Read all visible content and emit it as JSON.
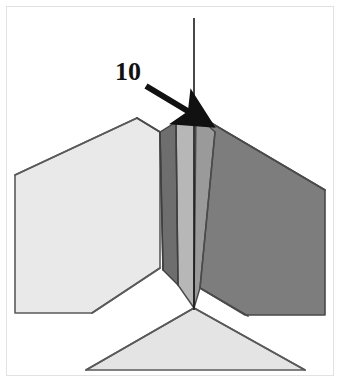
{
  "figure": {
    "background_color": "#ffffff",
    "frame_color": "#e2e2e2",
    "outline_color": "#4a4a4a",
    "axis_color": "#1a1a1a"
  },
  "callouts": [
    {
      "id": "callout-10",
      "label": "10",
      "label_x": 115,
      "label_y": 80,
      "color": "#111111",
      "arrow": {
        "name": "leader-arrow",
        "from_x": 146,
        "from_y": 86,
        "to_x": 196,
        "to_y": 117,
        "color": "#111111"
      }
    }
  ],
  "axis": {
    "name": "vertical-centre-axis",
    "x": 194,
    "y_top": 18,
    "y_bottom": 310,
    "color": "#1a1a1a",
    "width": 1.6
  },
  "surfaces": [
    {
      "name": "left-panel-face",
      "fill": "#e9e9e9",
      "stroke": "#5a5a5a",
      "points": "15,175 137,118 160,132 160,268 92,313 15,313"
    },
    {
      "name": "right-panel-face",
      "fill": "#7d7d7d",
      "stroke": "#4a4a4a",
      "points": "196,114 325,190 325,315 245,315 200,288 196,200"
    },
    {
      "name": "groove-left-dark-face",
      "fill": "#6e6e6e",
      "stroke": "#3f3f3f",
      "points": "160,132 176,122 178,285 163,270"
    },
    {
      "name": "groove-inner-light-face",
      "fill": "#b7b7b7",
      "stroke": "#4a4a4a",
      "points": "176,122 196,114 194,308 178,285"
    },
    {
      "name": "groove-right-face",
      "fill": "#9a9a9a",
      "stroke": "#4a4a4a",
      "points": "196,114 215,132 200,288 194,308"
    },
    {
      "name": "bottom-panel-face",
      "fill": "#e4e4e4",
      "stroke": "#5a5a5a",
      "points": "194,308 305,370 86,370"
    },
    {
      "name": "bottom-left-white-gap",
      "fill": "#ffffff",
      "stroke": "none",
      "points": "160,268 194,308 86,370 15,370 15,313"
    },
    {
      "name": "bottom-right-white-gap",
      "fill": "#ffffff",
      "stroke": "none",
      "points": "200,288 245,315 325,315 325,370 305,370 194,308"
    }
  ],
  "edges": [
    {
      "name": "left-panel-top-edge",
      "x1": 15,
      "y1": 175,
      "x2": 137,
      "y2": 118,
      "color": "#5a5a5a"
    },
    {
      "name": "left-panel-ridge-edge",
      "x1": 137,
      "y1": 118,
      "x2": 160,
      "y2": 132,
      "color": "#4a4a4a"
    },
    {
      "name": "groove-left-fold-edge",
      "x1": 160,
      "y1": 132,
      "x2": 163,
      "y2": 270,
      "color": "#3f3f3f"
    },
    {
      "name": "groove-valley-edge",
      "x1": 176,
      "y1": 122,
      "x2": 178,
      "y2": 285,
      "color": "#3f3f3f"
    },
    {
      "name": "groove-apex-edge",
      "x1": 196,
      "y1": 114,
      "x2": 194,
      "y2": 308,
      "color": "#2a2a2a"
    },
    {
      "name": "groove-right-fold-edge",
      "x1": 215,
      "y1": 132,
      "x2": 200,
      "y2": 288,
      "color": "#4a4a4a"
    },
    {
      "name": "right-panel-top-edge",
      "x1": 196,
      "y1": 114,
      "x2": 325,
      "y2": 190,
      "color": "#4a4a4a"
    },
    {
      "name": "left-panel-bottom-edge",
      "x1": 160,
      "y1": 268,
      "x2": 92,
      "y2": 313,
      "color": "#5a5a5a"
    },
    {
      "name": "right-panel-bottom-edge",
      "x1": 200,
      "y1": 288,
      "x2": 248,
      "y2": 316,
      "color": "#4a4a4a"
    },
    {
      "name": "bottom-panel-left-edge",
      "x1": 194,
      "y1": 308,
      "x2": 86,
      "y2": 370,
      "color": "#5a5a5a"
    },
    {
      "name": "bottom-panel-right-edge",
      "x1": 194,
      "y1": 308,
      "x2": 305,
      "y2": 370,
      "color": "#5a5a5a"
    }
  ]
}
